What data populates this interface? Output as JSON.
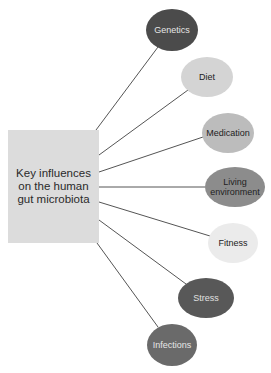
{
  "diagram": {
    "center": {
      "label": "Key influences on the human gut microbiota",
      "lines": [
        "Key",
        "influences",
        "on the",
        "human gut",
        "microbiota"
      ],
      "fill": "#dcdcdc"
    },
    "nodes": [
      {
        "label": "Genetics",
        "cx": 172,
        "cy": 30,
        "rx": 26,
        "ry": 21,
        "fill": "#4b4b4b",
        "text": "#e6e6e6"
      },
      {
        "label": "Diet",
        "cx": 207,
        "cy": 77,
        "rx": 26,
        "ry": 20,
        "fill": "#d4d4d4",
        "text": "#222222"
      },
      {
        "label": "Medication",
        "cx": 228,
        "cy": 133,
        "rx": 26,
        "ry": 20,
        "fill": "#bcbcbc",
        "text": "#222222"
      },
      {
        "label": "Living environment",
        "cx": 235,
        "cy": 187,
        "rx": 30,
        "ry": 20,
        "fill": "#8c8c8c",
        "text": "#222222"
      },
      {
        "label": "Fitness",
        "cx": 233,
        "cy": 243,
        "rx": 25,
        "ry": 20,
        "fill": "#ebebeb",
        "text": "#222222"
      },
      {
        "label": "Stress",
        "cx": 206,
        "cy": 298,
        "rx": 28,
        "ry": 20,
        "fill": "#585858",
        "text": "#e0e0e0"
      },
      {
        "label": "Infections",
        "cx": 172,
        "cy": 345,
        "rx": 25,
        "ry": 21,
        "fill": "#6a6a6a",
        "text": "#e6e6e6"
      }
    ],
    "connectors": [
      {
        "x1": 96,
        "y1": 130,
        "x2": 158,
        "y2": 47
      },
      {
        "x1": 99,
        "y1": 155,
        "x2": 188,
        "y2": 90
      },
      {
        "x1": 99,
        "y1": 172,
        "x2": 203,
        "y2": 137
      },
      {
        "x1": 99,
        "y1": 187,
        "x2": 205,
        "y2": 187
      },
      {
        "x1": 99,
        "y1": 202,
        "x2": 210,
        "y2": 236
      },
      {
        "x1": 99,
        "y1": 220,
        "x2": 186,
        "y2": 284
      },
      {
        "x1": 97,
        "y1": 243,
        "x2": 158,
        "y2": 327
      }
    ],
    "line_color": "#555555"
  }
}
